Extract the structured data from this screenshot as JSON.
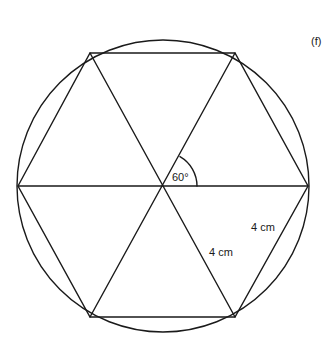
{
  "figure": {
    "label": "(f)",
    "angle_label": "60°",
    "side_labels": [
      "4 cm",
      "4 cm"
    ],
    "shape": "regular hexagon inscribed in circle, divided into 6 equilateral triangles",
    "colors": {
      "stroke": "#1a1a1a",
      "background": "#ffffff"
    }
  }
}
